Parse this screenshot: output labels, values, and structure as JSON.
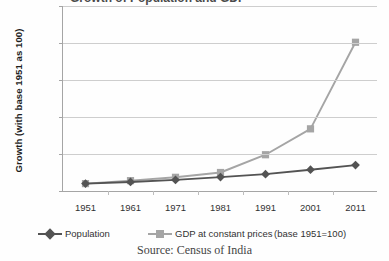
{
  "chart_data": {
    "type": "line",
    "title": "Growth of Population and GDP",
    "xlabel": "",
    "ylabel": "Growth (with base 1951 as 100)",
    "categories": [
      "1951",
      "1961",
      "1971",
      "1981",
      "1991",
      "2001",
      "2011"
    ],
    "x": [
      1951,
      1961,
      1971,
      1981,
      1991,
      2001,
      2011
    ],
    "ylim": [
      0,
      2500
    ],
    "yticks": [
      0,
      500,
      1000,
      1500,
      2000,
      2500
    ],
    "ytick_labels": [
      "0",
      "500",
      "1000",
      "1500",
      "2000",
      "2500"
    ],
    "grid": true,
    "legend_position": "bottom",
    "series": [
      {
        "name": "Population",
        "marker": "diamond",
        "color": "#3d3d3d",
        "values": [
          100,
          122,
          150,
          188,
          228,
          288,
          350
        ]
      },
      {
        "name": "GDP at constant prices",
        "marker": "square",
        "color": "#9a9a9a",
        "values": [
          100,
          140,
          185,
          250,
          490,
          840,
          2010
        ]
      }
    ],
    "annotations": [
      "(base 1951=100)"
    ],
    "source": "Source: Census of India"
  },
  "legend": {
    "population_label": "Population",
    "gdp_label": "GDP at constant prices",
    "note": "(base 1951=100)"
  },
  "caption": {
    "source": "Source: Census of India"
  },
  "axis": {
    "y_title": "Growth (with base 1951 as 100)"
  },
  "colors": {
    "population": "#3d3d3d",
    "gdp": "#9a9a9a",
    "gridline": "#c9c9c9",
    "axis": "#9a9a9a"
  }
}
